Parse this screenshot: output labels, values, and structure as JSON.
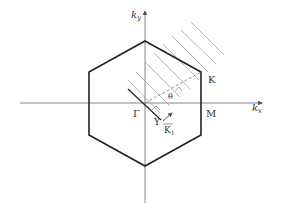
{
  "diagram": {
    "type": "brillouin-zone-hexagonal",
    "axes": {
      "x_label": "k",
      "x_sub": "x",
      "y_label": "k",
      "y_sub": "y"
    },
    "points": {
      "gamma": "Γ",
      "k": "K",
      "m": "M",
      "y": "Y",
      "k1": "K",
      "k1_sub": "1",
      "angle": "θ"
    },
    "colors": {
      "hexagon": "#222222",
      "axes": "#555555",
      "hatch": "#999999",
      "dashed": "#777777"
    }
  }
}
